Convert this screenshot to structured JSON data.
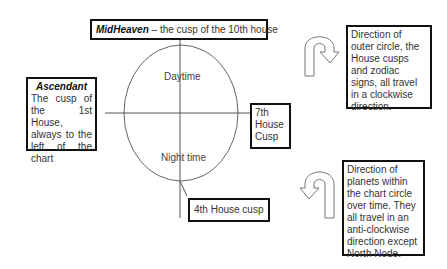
{
  "diagram": {
    "midheaven": {
      "title": "MidHeaven",
      "text": " – the cusp of the 10th house"
    },
    "ascendant": {
      "title": "Ascendant",
      "text": "The cusp of the 1st House, always to the left of the chart"
    },
    "seventh_house": {
      "text": "7th House Cusp"
    },
    "fourth_house": {
      "text": "4th House cusp"
    },
    "chart_labels": {
      "top": "Daytime",
      "bottom": "Night time"
    },
    "outer_direction": {
      "icon": "clockwise-u-turn-arrow",
      "text": "Direction of outer circle, the House cusps and zodiac signs, all travel in a clockwise direction."
    },
    "planet_direction": {
      "icon": "anticlockwise-u-turn-arrow",
      "text": "Direction of planets within the chart circle over time. They all travel in an anti-clockwise direction except North Node."
    },
    "colors": {
      "line": "#555555",
      "border": "#111111",
      "background": "#ffffff"
    }
  }
}
